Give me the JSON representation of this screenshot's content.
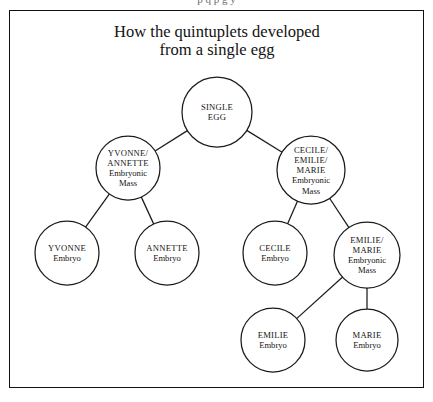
{
  "page": {
    "bleed_text": "p q p g y",
    "background": "#ffffff",
    "frame_color": "#111111",
    "ink_color": "#1b1b1b"
  },
  "title": {
    "line1": "How the quintuplets developed",
    "line2": "from a single egg"
  },
  "diagram": {
    "type": "tree",
    "nodes": [
      {
        "id": "single-egg",
        "lines": [
          "SINGLE",
          "EGG"
        ],
        "styles": [
          "caps",
          "caps"
        ],
        "cx": 217,
        "cy": 112,
        "r": 35,
        "level": 0
      },
      {
        "id": "yvonne-annette-mass",
        "lines": [
          "YVONNE/",
          "ANNETTE",
          "Embryonic",
          "Mass"
        ],
        "styles": [
          "caps",
          "caps",
          "sub",
          "sub"
        ],
        "cx": 128,
        "cy": 168,
        "r": 32,
        "level": 1
      },
      {
        "id": "cecile-emilie-marie-mass",
        "lines": [
          "CECILE/",
          "EMILIE/",
          "MARIE",
          "Embryonic",
          "Mass"
        ],
        "styles": [
          "caps",
          "caps",
          "caps",
          "sub",
          "sub"
        ],
        "cx": 311,
        "cy": 170,
        "r": 34,
        "level": 1
      },
      {
        "id": "yvonne-embryo",
        "lines": [
          "YVONNE",
          "Embryo"
        ],
        "styles": [
          "caps",
          "sub"
        ],
        "cx": 67,
        "cy": 253,
        "r": 32,
        "level": 2
      },
      {
        "id": "annette-embryo",
        "lines": [
          "ANNETTE",
          "Embryo"
        ],
        "styles": [
          "caps",
          "sub"
        ],
        "cx": 167,
        "cy": 253,
        "r": 32,
        "level": 2
      },
      {
        "id": "cecile-embryo",
        "lines": [
          "CECILE",
          "Embryo"
        ],
        "styles": [
          "caps",
          "sub"
        ],
        "cx": 275,
        "cy": 253,
        "r": 32,
        "level": 2
      },
      {
        "id": "emilie-marie-mass",
        "lines": [
          "EMILIE/",
          "MARIE",
          "Embryonic",
          "Mass"
        ],
        "styles": [
          "caps",
          "caps",
          "sub",
          "sub"
        ],
        "cx": 367,
        "cy": 255,
        "r": 33,
        "level": 2
      },
      {
        "id": "emilie-embryo",
        "lines": [
          "EMILIE",
          "Embryo"
        ],
        "styles": [
          "caps",
          "sub"
        ],
        "cx": 273,
        "cy": 340,
        "r": 32,
        "level": 3
      },
      {
        "id": "marie-embryo",
        "lines": [
          "MARIE",
          "Embryo"
        ],
        "styles": [
          "caps",
          "sub"
        ],
        "cx": 367,
        "cy": 340,
        "r": 31,
        "level": 3
      }
    ],
    "edges": [
      {
        "id": "edge-single-egg-to-yvonne-annette",
        "from": "single-egg",
        "to": "yvonne-annette-mass"
      },
      {
        "id": "edge-single-egg-to-cecile-emilie-marie",
        "from": "single-egg",
        "to": "cecile-emilie-marie-mass"
      },
      {
        "id": "edge-yvonne-annette-to-yvonne",
        "from": "yvonne-annette-mass",
        "to": "yvonne-embryo"
      },
      {
        "id": "edge-yvonne-annette-to-annette",
        "from": "yvonne-annette-mass",
        "to": "annette-embryo"
      },
      {
        "id": "edge-cecile-emilie-marie-to-cecile",
        "from": "cecile-emilie-marie-mass",
        "to": "cecile-embryo"
      },
      {
        "id": "edge-cecile-emilie-marie-to-emilie-marie",
        "from": "cecile-emilie-marie-mass",
        "to": "emilie-marie-mass"
      },
      {
        "id": "edge-emilie-marie-to-emilie",
        "from": "emilie-marie-mass",
        "to": "emilie-embryo"
      },
      {
        "id": "edge-emilie-marie-to-marie",
        "from": "emilie-marie-mass",
        "to": "marie-embryo"
      }
    ]
  }
}
